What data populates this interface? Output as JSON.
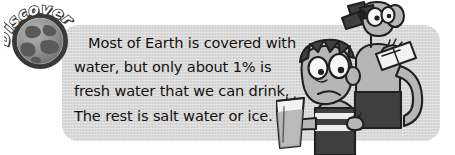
{
  "graphic": {
    "kind": "educational-textbook-callout",
    "badge": {
      "label": "Discover!",
      "icon": "globe-icon",
      "ring_color": "#3a3a3a",
      "globe_ocean_color": "#8d8d8d",
      "globe_land_color": "#5a5a5a",
      "text_color": "#ffffff"
    },
    "panel": {
      "background_color": "#d8d8d8",
      "corner_radius_px": 16
    },
    "body_text": {
      "full_text": "Most of Earth is covered with water, but only about 1% is fresh water that we can drink. The rest is salt water or ice.",
      "text_color": "#14110f",
      "lines": [
        "Most of Earth is covered with",
        "water, but only about 1% is",
        "fresh water that we can drink.",
        "The rest is salt water or ice."
      ],
      "highlighted_value": "1%"
    },
    "illustration": {
      "description": "Two cartoon kids at the right side of the panel",
      "characters": [
        {
          "name": "boy-character",
          "features": "spiky hair, large eyes, frowning mouth, striped shirt",
          "holding": "glass of water",
          "skin_color": "#b9b9b9",
          "shirt_color": "#3f3f3f"
        },
        {
          "name": "girl-character",
          "features": "dark hair bow, large eyes, long arm",
          "holding": "folded paper card",
          "skin_color": "#b0b0b0",
          "shirt_color": "#3f3f3f"
        }
      ],
      "props": [
        {
          "name": "water-glass-icon",
          "label": "glass of water"
        },
        {
          "name": "paper-card-icon",
          "label": "folded paper"
        },
        {
          "name": "hair-bow-icon",
          "label": "hair bow"
        }
      ]
    }
  }
}
